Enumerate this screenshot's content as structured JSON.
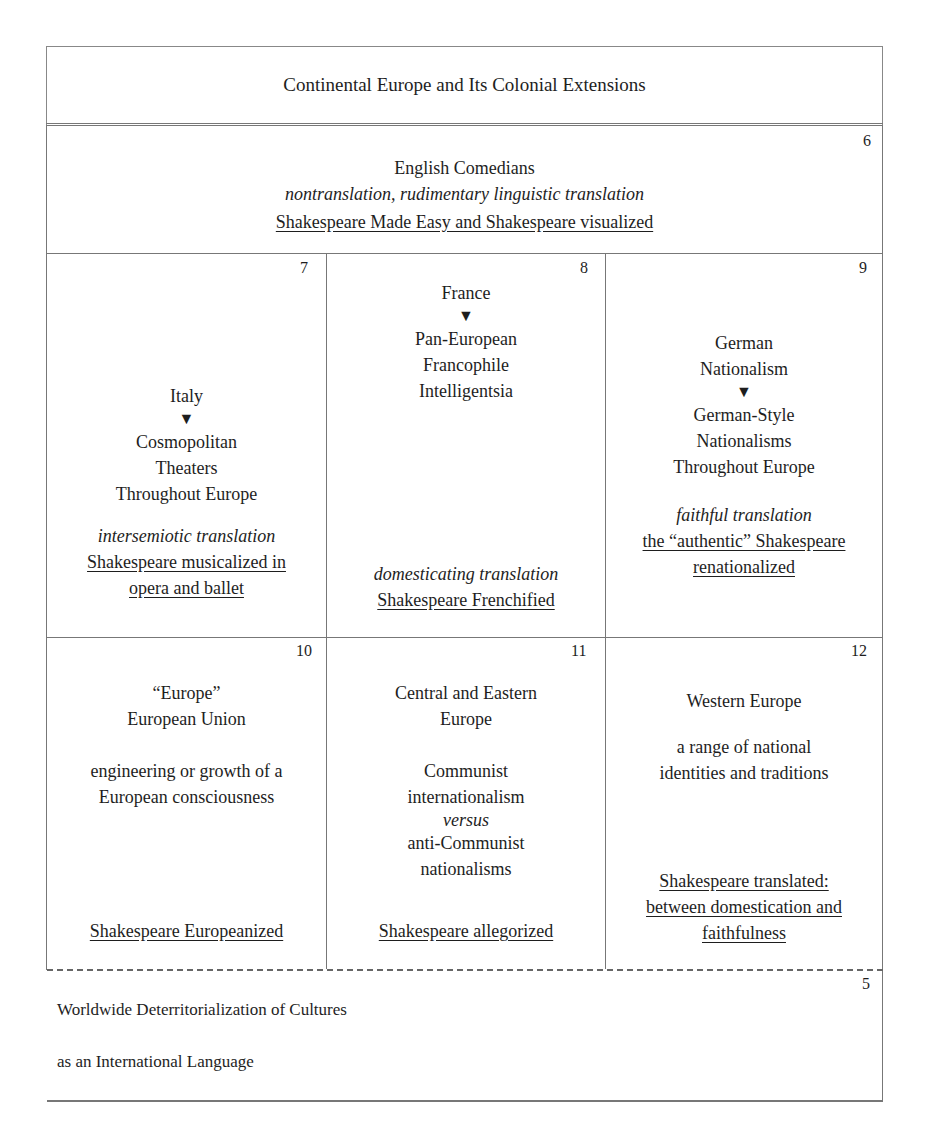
{
  "header": {
    "title": "Continental Europe and Its Colonial Extensions"
  },
  "arrow_glyph": "▼",
  "box6": {
    "number": "6",
    "title": "English Comedians",
    "translation_mode": "nontranslation, rudimentary linguistic translation",
    "outcome": "Shakespeare Made Easy and Shakespeare visualized"
  },
  "box7": {
    "number": "7",
    "origin": "Italy",
    "target": [
      "Cosmopolitan",
      "Theaters",
      "Throughout Europe"
    ],
    "translation_mode": "intersemiotic translation",
    "outcome": [
      "Shakespeare musicalized in",
      "opera and ballet"
    ]
  },
  "box8": {
    "number": "8",
    "origin": "France",
    "target": [
      "Pan-European",
      "Francophile",
      "Intelligentsia"
    ],
    "translation_mode": "domesticating translation",
    "outcome": [
      "Shakespeare Frenchified"
    ]
  },
  "box9": {
    "number": "9",
    "origin": [
      "German",
      "Nationalism"
    ],
    "target": [
      "German-Style",
      "Nationalisms",
      "Throughout Europe"
    ],
    "translation_mode": "faithful translation",
    "outcome": [
      "the “authentic” Shakespeare",
      "renationalized"
    ]
  },
  "box10": {
    "number": "10",
    "title": [
      "“Europe”",
      "European Union"
    ],
    "description": [
      "engineering or growth of a",
      "European consciousness"
    ],
    "outcome": "Shakespeare Europeanized"
  },
  "box11": {
    "number": "11",
    "title": [
      "Central and Eastern",
      "Europe"
    ],
    "description": [
      "Communist",
      "internationalism"
    ],
    "versus": "versus",
    "description2": [
      "anti-Communist",
      "nationalisms"
    ],
    "outcome": "Shakespeare allegorized"
  },
  "box12": {
    "number": "12",
    "title": "Western Europe",
    "description": [
      "a range of national",
      "identities and traditions"
    ],
    "outcome": [
      "Shakespeare translated:",
      "between domestication and",
      "faithfulness"
    ]
  },
  "box5": {
    "number": "5",
    "line1": "Worldwide Deterritorialization of Cultures",
    "line2": "as an International Language"
  }
}
